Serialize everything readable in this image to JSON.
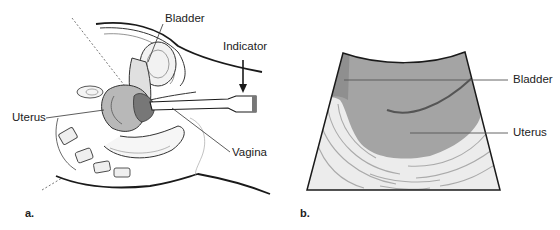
{
  "panel_a": {
    "letter": "a.",
    "labels": {
      "bladder": "Bladder",
      "indicator": "Indicator",
      "uterus": "Uterus",
      "vagina": "Vagina"
    }
  },
  "panel_b": {
    "letter": "b.",
    "labels": {
      "bladder": "Bladder",
      "uterus": "Uterus"
    }
  },
  "colors": {
    "outline": "#1a1a1a",
    "bladder_gray": "#8f8f8f",
    "uterus_gray": "#a4a4a4",
    "tissue_light": "#ececec",
    "leader_line": "#555555"
  }
}
